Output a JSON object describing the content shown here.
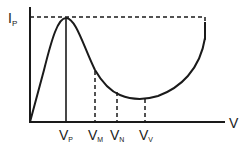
{
  "diagram": {
    "y_axis": {
      "label_main": "I",
      "label_sub": "P"
    },
    "x_axis": {
      "label": "V"
    },
    "markers": [
      {
        "main": "V",
        "sub": "P",
        "style": "solid"
      },
      {
        "main": "V",
        "sub": "M",
        "style": "dashed"
      },
      {
        "main": "V",
        "sub": "N",
        "style": "dashed"
      },
      {
        "main": "V",
        "sub": "V",
        "style": "dashed"
      }
    ],
    "colors": {
      "line": "#1a1a1a",
      "background": "#ffffff"
    }
  }
}
